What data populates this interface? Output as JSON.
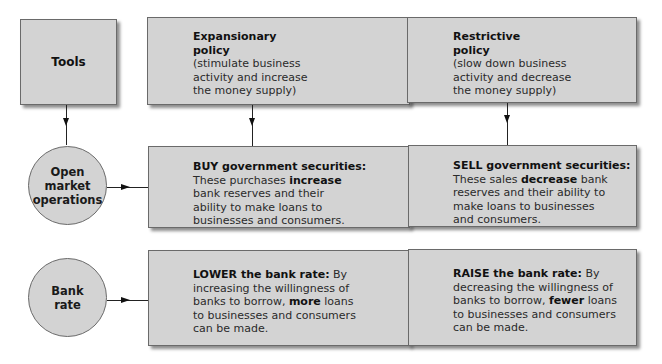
{
  "diagram": {
    "tools_box": {
      "label": "Tools"
    },
    "expansionary": {
      "title_line1": "Expansionary",
      "title_line2": "policy",
      "desc_line1": "(stimulate business",
      "desc_line2": "activity and increase",
      "desc_line3": "the money supply)"
    },
    "restrictive": {
      "title_line1": "Restrictive",
      "title_line2": "policy",
      "desc_line1": "(slow down business",
      "desc_line2": "activity and decrease",
      "desc_line3": "the money supply)"
    },
    "open_market": {
      "line1": "Open",
      "line2": "market",
      "line3": "operations"
    },
    "bank_rate": {
      "line1": "Bank",
      "line2": "rate"
    },
    "buy_box": {
      "heading": "BUY government securities:",
      "l1_pre": "These purchases ",
      "l1_bold": "increase",
      "line2": "bank reserves and their",
      "line3": "ability to make loans to",
      "line4": "businesses and consumers."
    },
    "sell_box": {
      "heading": "SELL government securities:",
      "l1_pre": "These sales ",
      "l1_bold": "decrease",
      "l1_post": " bank",
      "line2": "reserves and their ability to",
      "line3": "make loans to businesses",
      "line4": "and consumers."
    },
    "lower_box": {
      "heading": "LOWER the bank rate:",
      "heading_post": " By",
      "line2": "increasing the willingness of",
      "l3_pre": "banks to borrow, ",
      "l3_bold": "more",
      "l3_post": " loans",
      "line4": "to businesses and consumers",
      "line5": "can be made."
    },
    "raise_box": {
      "heading": "RAISE the bank rate:",
      "heading_post": " By",
      "line2": "decreasing the willingness of",
      "l3_pre": "banks to borrow, ",
      "l3_bold": "fewer",
      "l3_post": " loans",
      "line4": "to businesses and consumers",
      "line5": "can be made."
    },
    "colors": {
      "box_fill": "#d3d3d3",
      "border": "#6a6a6a",
      "text": "#1a1a1a"
    }
  }
}
